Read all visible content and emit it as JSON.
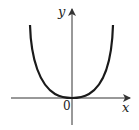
{
  "diagram": {
    "type": "function-graph",
    "curve": "even-power (y = x^4 shape)",
    "labels": {
      "y_axis": "y",
      "x_axis": "x",
      "origin": "0"
    },
    "colors": {
      "curve": "#1a1a1a",
      "axes": "#333333"
    }
  }
}
